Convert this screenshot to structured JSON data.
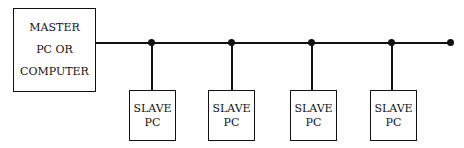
{
  "diagram": {
    "type": "bus-topology",
    "master": {
      "lines": [
        "MASTER",
        "PC OR",
        "COMPUTER"
      ]
    },
    "slaves": [
      {
        "lines": [
          "SLAVE",
          "PC"
        ],
        "x": 129,
        "junction_x": 151
      },
      {
        "lines": [
          "SLAVE",
          "PC"
        ],
        "x": 208,
        "junction_x": 231
      },
      {
        "lines": [
          "SLAVE",
          "PC"
        ],
        "x": 290,
        "junction_x": 311
      },
      {
        "lines": [
          "SLAVE",
          "PC"
        ],
        "x": 370,
        "junction_x": 392
      }
    ],
    "bus_end_x": 450
  }
}
